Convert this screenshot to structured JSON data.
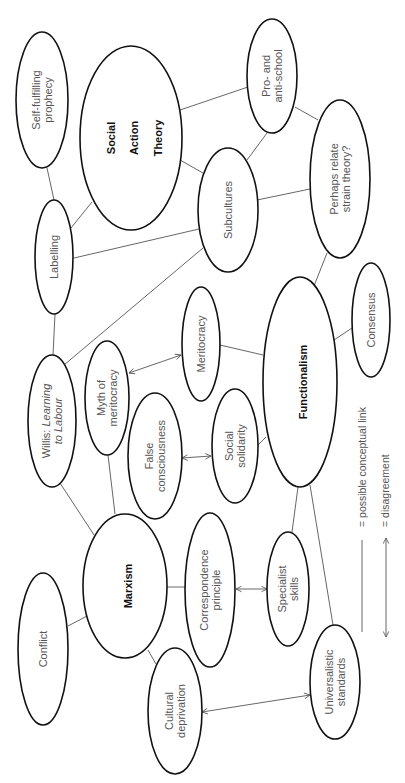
{
  "colors": {
    "outline": "#111111",
    "line": "#555555",
    "text": "#555555",
    "major_text": "#111111",
    "background": "#ffffff"
  },
  "nodes": [
    {
      "id": "self-fulfilling-prophecy",
      "lines": [
        "Self-fulfilling",
        "prophecy"
      ],
      "cx": 42,
      "cy": 100,
      "rx": 26,
      "ry": 68,
      "major": false
    },
    {
      "id": "social-action-theory",
      "lines": [
        "Social",
        "Action",
        "Theory"
      ],
      "cx": 131,
      "cy": 138,
      "rx": 51,
      "ry": 92,
      "major": true,
      "font_size": 21
    },
    {
      "id": "pro-anti-school",
      "lines": [
        "Pro- and",
        "anti-school"
      ],
      "cx": 272,
      "cy": 76,
      "rx": 25,
      "ry": 57,
      "major": false
    },
    {
      "id": "subcultures",
      "lines": [
        "Subcultures"
      ],
      "cx": 228,
      "cy": 210,
      "rx": 30,
      "ry": 62,
      "major": false
    },
    {
      "id": "strain-theory",
      "lines": [
        "Perhaps relate",
        "strain theory?"
      ],
      "cx": 340,
      "cy": 179,
      "rx": 30,
      "ry": 79,
      "major": false
    },
    {
      "id": "labelling",
      "lines": [
        "Labelling"
      ],
      "cx": 54,
      "cy": 257,
      "rx": 19,
      "ry": 57,
      "major": false
    },
    {
      "id": "meritocracy",
      "lines": [
        "Meritocracy"
      ],
      "cx": 201,
      "cy": 344,
      "rx": 19,
      "ry": 57,
      "major": false
    },
    {
      "id": "consensus",
      "lines": [
        "Consensus"
      ],
      "cx": 371,
      "cy": 320,
      "rx": 19,
      "ry": 57,
      "major": false
    },
    {
      "id": "functionalism",
      "lines": [
        "Functionalism"
      ],
      "cx": 300,
      "cy": 382,
      "rx": 37,
      "ry": 105,
      "major": true,
      "font_size": 21
    },
    {
      "id": "willis",
      "lines": [
        "Willis: Learning",
        "to Labour"
      ],
      "italic_span": "Learning to Labour",
      "cx": 52,
      "cy": 421,
      "rx": 24,
      "ry": 66,
      "major": false
    },
    {
      "id": "myth-of-meritocracy",
      "lines": [
        "Myth of",
        "meritocracy"
      ],
      "cx": 107,
      "cy": 398,
      "rx": 22,
      "ry": 57,
      "major": false
    },
    {
      "id": "false-consciousness",
      "lines": [
        "False",
        "consciousness"
      ],
      "cx": 155,
      "cy": 456,
      "rx": 27,
      "ry": 63,
      "major": false
    },
    {
      "id": "social-solidarity",
      "lines": [
        "Social",
        "solidarity"
      ],
      "cx": 235,
      "cy": 446,
      "rx": 23,
      "ry": 57,
      "major": false
    },
    {
      "id": "marxism",
      "lines": [
        "Marxism"
      ],
      "cx": 125,
      "cy": 586,
      "rx": 42,
      "ry": 72,
      "major": true,
      "font_size": 21
    },
    {
      "id": "correspondence-principle",
      "lines": [
        "Correspondence",
        "principle"
      ],
      "cx": 210,
      "cy": 590,
      "rx": 25,
      "ry": 77,
      "major": false
    },
    {
      "id": "specialist-skills",
      "lines": [
        "Specialist",
        "skills"
      ],
      "cx": 288,
      "cy": 589,
      "rx": 21,
      "ry": 57,
      "major": false
    },
    {
      "id": "conflict",
      "lines": [
        "Conflict"
      ],
      "cx": 43,
      "cy": 649,
      "rx": 25,
      "ry": 76,
      "major": false
    },
    {
      "id": "cultural-deprivation",
      "lines": [
        "Cultural",
        "deprivation"
      ],
      "cx": 175,
      "cy": 711,
      "rx": 27,
      "ry": 63,
      "major": false
    },
    {
      "id": "universalistic-standards",
      "lines": [
        "Universalistic",
        "standards"
      ],
      "cx": 335,
      "cy": 682,
      "rx": 25,
      "ry": 57,
      "major": false
    }
  ],
  "links": [
    {
      "from": "self-fulfilling-prophecy",
      "to": "labelling",
      "x1": 47,
      "y1": 168,
      "x2": 54,
      "y2": 200
    },
    {
      "from": "social-action-theory",
      "to": "labelling",
      "x1": 92,
      "y1": 202,
      "x2": 71,
      "y2": 228
    },
    {
      "from": "social-action-theory",
      "to": "pro-anti-school",
      "x1": 180,
      "y1": 110,
      "x2": 248,
      "y2": 87
    },
    {
      "from": "social-action-theory",
      "to": "subcultures",
      "x1": 180,
      "y1": 160,
      "x2": 203,
      "y2": 173
    },
    {
      "from": "pro-anti-school",
      "to": "subcultures",
      "x1": 267,
      "y1": 133,
      "x2": 247,
      "y2": 160
    },
    {
      "from": "pro-anti-school",
      "to": "strain-theory",
      "x1": 295,
      "y1": 107,
      "x2": 318,
      "y2": 120
    },
    {
      "from": "subcultures",
      "to": "strain-theory",
      "x1": 257,
      "y1": 200,
      "x2": 310,
      "y2": 189
    },
    {
      "from": "labelling",
      "to": "subcultures",
      "x1": 74,
      "y1": 258,
      "x2": 199,
      "y2": 229
    },
    {
      "from": "labelling",
      "to": "willis",
      "x1": 55,
      "y1": 314,
      "x2": 53,
      "y2": 355
    },
    {
      "from": "willis",
      "to": "subcultures",
      "x1": 64,
      "y1": 365,
      "x2": 203,
      "y2": 248
    },
    {
      "from": "strain-theory",
      "to": "functionalism",
      "x1": 327,
      "y1": 253,
      "x2": 314,
      "y2": 286
    },
    {
      "from": "meritocracy",
      "to": "functionalism",
      "x1": 220,
      "y1": 345,
      "x2": 263,
      "y2": 355
    },
    {
      "from": "consensus",
      "to": "functionalism",
      "x1": 352,
      "y1": 328,
      "x2": 334,
      "y2": 340
    },
    {
      "from": "social-solidarity",
      "to": "functionalism",
      "x1": 258,
      "y1": 445,
      "x2": 266,
      "y2": 437
    },
    {
      "from": "willis",
      "to": "marxism",
      "x1": 60,
      "y1": 483,
      "x2": 94,
      "y2": 535
    },
    {
      "from": "myth-of-meritocracy",
      "to": "marxism",
      "x1": 108,
      "y1": 455,
      "x2": 115,
      "y2": 514
    },
    {
      "from": "marxism",
      "to": "conflict",
      "x1": 87,
      "y1": 616,
      "x2": 68,
      "y2": 626
    },
    {
      "from": "marxism",
      "to": "correspondence-principle",
      "x1": 167,
      "y1": 587,
      "x2": 186,
      "y2": 587
    },
    {
      "from": "marxism",
      "to": "cultural-deprivation",
      "x1": 148,
      "y1": 650,
      "x2": 156,
      "y2": 664
    },
    {
      "from": "functionalism",
      "to": "specialist-skills",
      "x1": 298,
      "y1": 487,
      "x2": 292,
      "y2": 532
    },
    {
      "from": "functionalism",
      "to": "universalistic-standards",
      "x1": 310,
      "y1": 485,
      "x2": 333,
      "y2": 625
    }
  ],
  "disagreements": [
    {
      "from": "myth-of-meritocracy",
      "to": "meritocracy",
      "x1": 129,
      "y1": 373,
      "x2": 181,
      "y2": 355
    },
    {
      "from": "false-consciousness",
      "to": "social-solidarity",
      "x1": 182,
      "y1": 458,
      "x2": 211,
      "y2": 456
    },
    {
      "from": "correspondence-principle",
      "to": "specialist-skills",
      "x1": 236,
      "y1": 589,
      "x2": 267,
      "y2": 589
    },
    {
      "from": "cultural-deprivation",
      "to": "universalistic-standards",
      "x1": 202,
      "y1": 712,
      "x2": 310,
      "y2": 695
    }
  ],
  "legend": {
    "link": {
      "label": "= possible conceptual link",
      "x": 362,
      "y1": 540,
      "y2": 632,
      "text_x": 366,
      "text_y": 527
    },
    "disagreement": {
      "label": "= disagreement",
      "x": 386,
      "y1": 538,
      "y2": 637,
      "text_x": 389,
      "text_y": 527
    }
  }
}
